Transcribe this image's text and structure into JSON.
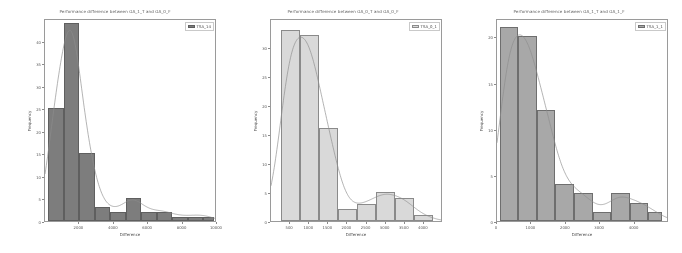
{
  "figure": {
    "background": "#ffffff",
    "panel_count": 3
  },
  "chart_data": [
    {
      "type": "bar",
      "title": "Performance difference between GA_1_T and GA_0_F",
      "xlabel": "Difference",
      "ylabel": "Frequency",
      "legend": [
        "TSA_14"
      ],
      "legend_position": "top-right",
      "grid": false,
      "bar_color": "#7d7d7d",
      "edge_color": "#5f5f5f",
      "kde_color": "#8d8d8d",
      "xlim": [
        0,
        10000
      ],
      "ylim": [
        0,
        45
      ],
      "xticks": [
        2000,
        4000,
        6000,
        8000,
        10000
      ],
      "yticks": [
        0,
        5,
        10,
        15,
        20,
        25,
        30,
        35,
        40
      ],
      "bin_edges": [
        200,
        1100,
        2000,
        2900,
        3800,
        4700,
        5600,
        6500,
        7400,
        8300,
        9200,
        9800
      ],
      "categories": [
        "200-1100",
        "1100-2000",
        "2000-2900",
        "2900-3800",
        "3800-4700",
        "4700-5600",
        "5600-6500",
        "6500-7400",
        "7400-8300",
        "8300-9200",
        "9200-9800"
      ],
      "values": [
        25,
        44,
        15,
        3,
        2,
        5,
        2,
        2,
        1,
        1,
        1
      ]
    },
    {
      "type": "bar",
      "title": "Performance difference between GA_0_T and GA_0_F",
      "xlabel": "Difference",
      "ylabel": "Frequency",
      "legend": [
        "TSA_0_1"
      ],
      "legend_position": "top-right",
      "grid": false,
      "bar_color": "#d9d9d9",
      "edge_color": "#8a8a8a",
      "kde_color": "#b5b5b5",
      "xlim": [
        0,
        4500
      ],
      "ylim": [
        0,
        35
      ],
      "xticks": [
        500,
        1000,
        1500,
        2000,
        2500,
        3000,
        3500,
        4000
      ],
      "yticks": [
        0,
        5,
        10,
        15,
        20,
        25,
        30
      ],
      "bin_edges": [
        250,
        750,
        1250,
        1750,
        2250,
        2750,
        3250,
        3750,
        4250
      ],
      "categories": [
        "250-750",
        "750-1250",
        "1250-1750",
        "1750-2250",
        "2250-2750",
        "2750-3250",
        "3250-3750",
        "3750-4250"
      ],
      "values": [
        33,
        32,
        16,
        2,
        3,
        5,
        4,
        1
      ]
    },
    {
      "type": "bar",
      "title": "Performance difference between GA_1_T and GA_1_F",
      "xlabel": "Difference",
      "ylabel": "Frequency",
      "legend": [
        "TSA_1_1"
      ],
      "legend_position": "top-right",
      "grid": false,
      "bar_color": "#a8a8a8",
      "edge_color": "#6e6e6e",
      "kde_color": "#8d8d8d",
      "xlim": [
        0,
        5000
      ],
      "ylim": [
        0,
        22
      ],
      "xticks": [
        0,
        1000,
        2000,
        3000,
        4000
      ],
      "yticks": [
        0,
        5,
        10,
        15,
        20
      ],
      "bin_edges": [
        80,
        620,
        1160,
        1700,
        2240,
        2780,
        3320,
        3860,
        4400,
        4800
      ],
      "categories": [
        "80-620",
        "620-1160",
        "1160-1700",
        "1700-2240",
        "2240-2780",
        "2780-3320",
        "3320-3860",
        "3860-4400",
        "4400-4800"
      ],
      "values": [
        21,
        20,
        12,
        4,
        3,
        1,
        3,
        2,
        1
      ]
    }
  ]
}
